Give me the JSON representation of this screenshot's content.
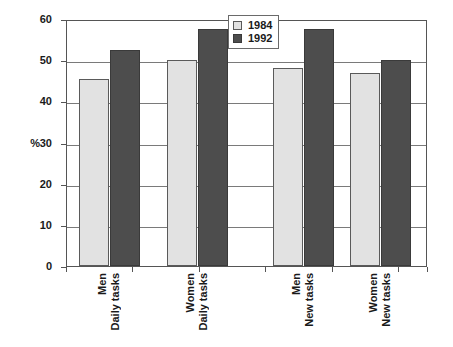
{
  "chart_data": {
    "type": "bar",
    "title": "",
    "xlabel": "",
    "ylabel": "%",
    "ylim": [
      0,
      60
    ],
    "ytick_step": 10,
    "ytick_labels": [
      "60",
      "50",
      "40",
      "30",
      "20",
      "10",
      "0"
    ],
    "grid": true,
    "legend_position": "top-center-right",
    "categories": [
      {
        "line1": "Men",
        "line2": "Daily tasks"
      },
      {
        "line1": "Women",
        "line2": "Daily tasks"
      },
      {
        "line1": "Men",
        "line2": "New tasks"
      },
      {
        "line1": "Women",
        "line2": "New tasks"
      }
    ],
    "series": [
      {
        "name": "1984",
        "color": "#e2e2e2",
        "values": [
          45.5,
          50.0,
          48.0,
          46.8
        ]
      },
      {
        "name": "1992",
        "color": "#4d4d4d",
        "values": [
          52.5,
          57.5,
          57.5,
          50.0
        ]
      }
    ]
  },
  "legend": {
    "entries": [
      {
        "label": "1984",
        "swatch": "light-gray-swatch"
      },
      {
        "label": "1992",
        "swatch": "dark-gray-swatch"
      }
    ]
  },
  "axis": {
    "y_title": "%"
  }
}
